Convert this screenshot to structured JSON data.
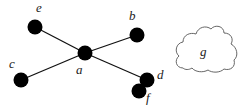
{
  "diagram": {
    "type": "graph",
    "nodes": [
      {
        "id": "a",
        "label": "a",
        "x": 85,
        "y": 53,
        "label_x": 76,
        "label_y": 74
      },
      {
        "id": "b",
        "label": "b",
        "x": 137,
        "y": 35,
        "label_x": 129,
        "label_y": 20
      },
      {
        "id": "c",
        "label": "c",
        "x": 21,
        "y": 80,
        "label_x": 9,
        "label_y": 68
      },
      {
        "id": "d",
        "label": "d",
        "x": 147,
        "y": 80,
        "label_x": 157,
        "label_y": 79
      },
      {
        "id": "e",
        "label": "e",
        "x": 35,
        "y": 27,
        "label_x": 36,
        "label_y": 12
      },
      {
        "id": "f",
        "label": "f",
        "x": 139,
        "y": 91,
        "label_x": 146,
        "label_y": 102
      }
    ],
    "edges": [
      {
        "from": "a",
        "to": "e"
      },
      {
        "from": "a",
        "to": "b"
      },
      {
        "from": "a",
        "to": "c"
      },
      {
        "from": "a",
        "to": "d"
      }
    ],
    "cloud": {
      "label": "g",
      "label_x": 200,
      "label_y": 56
    },
    "colors": {
      "node": "#000000",
      "edge": "#111111",
      "cloud_stroke": "#555555",
      "label": "#222222"
    }
  }
}
